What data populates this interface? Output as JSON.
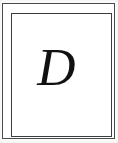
{
  "plate": {
    "letter": "D",
    "letter_case": "uppercase",
    "style": "italic-serif",
    "ink_color": "#111111",
    "background_color": "#ffffff",
    "paper_color": "#fdfdfc"
  },
  "frame": {
    "type": "double-rule-rectangle",
    "outer_rule_color": "#4a4a4a",
    "inner_rule_color": "#3c3c3c",
    "outer_rule_width_px": "1",
    "inner_rule_width_px": "1"
  }
}
